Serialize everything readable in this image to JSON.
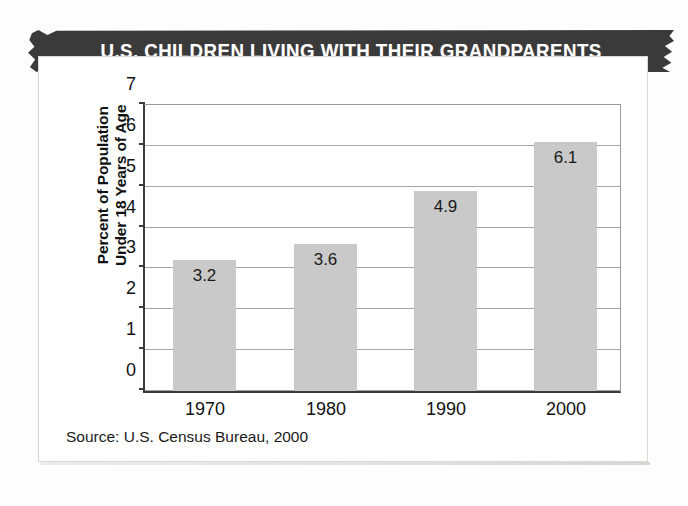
{
  "banner": {
    "title": "U.S. CHILDREN LIVING WITH THEIR GRANDPARENTS",
    "background_color": "#3a3a3a",
    "text_color": "#ffffff"
  },
  "source_note": "Source: U.S. Census Bureau, 2000",
  "colors": {
    "bar_fill": "#c9c9c9",
    "axis": "#3b3b3b",
    "gridline": "#a6a6a6",
    "card_border": "#d8d8d6",
    "text": "#111111"
  },
  "axis_title_lines": {
    "line1": "Percent of Population",
    "line2": "Under 18 Years of Age"
  },
  "chart_data": {
    "type": "bar",
    "title": "U.S. CHILDREN LIVING WITH THEIR GRANDPARENTS",
    "subtitle": "",
    "xlabel": "",
    "ylabel": "Percent of Population Under 18 Years of Age",
    "categories": [
      "1970",
      "1980",
      "1990",
      "2000"
    ],
    "values": [
      3.2,
      3.6,
      4.9,
      6.1
    ],
    "value_labels": [
      "3.2",
      "3.6",
      "4.9",
      "6.1"
    ],
    "ylim": [
      0,
      7
    ],
    "ytick_step": 1,
    "yticks": [
      "0",
      "1",
      "2",
      "3",
      "4",
      "5",
      "6",
      "7"
    ],
    "grid": true,
    "grid_axis": "y",
    "legend": false,
    "legend_position": "none",
    "source": "Source: U.S. Census Bureau, 2000"
  }
}
